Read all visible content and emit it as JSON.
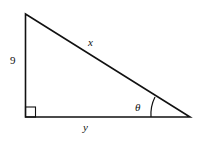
{
  "diagram": {
    "type": "right-triangle",
    "labels": {
      "vertical_side": "9",
      "hypotenuse": "x",
      "horizontal_side": "y",
      "angle": "θ"
    },
    "right_angle_marker": "bottom-left",
    "angle_location": "bottom-right"
  }
}
